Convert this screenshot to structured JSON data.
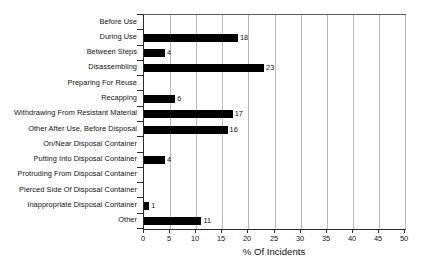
{
  "chart_data": {
    "type": "bar",
    "orientation": "horizontal",
    "title": "",
    "subtitle": "",
    "xlabel": "% Of Incidents",
    "ylabel": "",
    "xlim": [
      0,
      50
    ],
    "xticks": [
      0,
      5,
      10,
      15,
      20,
      25,
      30,
      35,
      40,
      45,
      50
    ],
    "xtick_labels": [
      "0",
      "5",
      "10",
      "15",
      "20",
      "25",
      "30",
      "35",
      "40",
      "45",
      "50"
    ],
    "grid": {
      "vertical": true,
      "horizontal": false,
      "color": "#b9b9b9"
    },
    "legend": null,
    "bar_color": "#000000",
    "value_labels": true,
    "categories": [
      "Before Use",
      "During Use",
      "Between Steps",
      "Disassembling",
      "Preparing For Reuse",
      "Recapping",
      "Withdrawing From Resistant Material",
      "Other After Use, Before Disposal",
      "On/Near Disposal Container",
      "Putting Into Disposal Container",
      "Protruding From Disposal Container",
      "Pierced Side Of Disposal Container",
      "Inappropriate Disposal Container",
      "Other"
    ],
    "values": [
      0,
      18,
      4,
      23,
      0,
      6,
      17,
      16,
      0,
      4,
      0,
      0,
      1,
      11
    ],
    "value_label_text": [
      "",
      "18",
      "4",
      "23",
      "",
      "6",
      "17",
      "16",
      "",
      "4",
      "",
      "",
      "1",
      "11"
    ]
  }
}
